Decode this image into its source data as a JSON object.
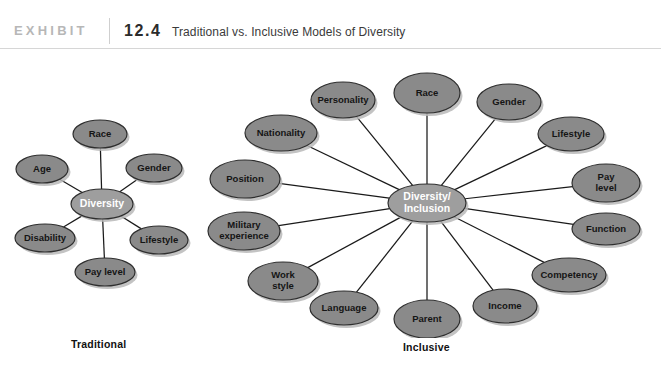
{
  "header": {
    "exhibit_word": "EXHIBIT",
    "exhibit_number": "12.4",
    "title": "Traditional vs. Inclusive Models of Diversity"
  },
  "captions": {
    "traditional": "Traditional",
    "inclusive": "Inclusive"
  },
  "source_credit": "",
  "colors": {
    "satellite_fill": "#8a8a8a",
    "center_fill": "#9e9e9e",
    "node_stroke": "#2e2e2e",
    "shadow": "#b9b9b9",
    "connector": "#1a1a1a",
    "satellite_text": "#151515",
    "center_text": "#ffffff",
    "rule": "#d6d6d6",
    "exhibit_word_color": "#b7b7b7"
  },
  "diagrams": [
    {
      "id": "traditional",
      "name": "traditional-diversity-model",
      "center": {
        "label": "Diversity",
        "lines": [
          "Diversity"
        ],
        "cx": 102,
        "cy": 154,
        "rx": 31,
        "ry": 15
      },
      "satellites": [
        {
          "label": "Race",
          "lines": [
            "Race"
          ],
          "cx": 100,
          "cy": 84,
          "rx": 27,
          "ry": 14
        },
        {
          "label": "Gender",
          "lines": [
            "Gender"
          ],
          "cx": 154,
          "cy": 118,
          "rx": 28,
          "ry": 14
        },
        {
          "label": "Lifestyle",
          "lines": [
            "Lifestyle"
          ],
          "cx": 159,
          "cy": 190,
          "rx": 29,
          "ry": 14
        },
        {
          "label": "Pay level",
          "lines": [
            "Pay level"
          ],
          "cx": 105,
          "cy": 222,
          "rx": 30,
          "ry": 14
        },
        {
          "label": "Disability",
          "lines": [
            "Disability"
          ],
          "cx": 45,
          "cy": 188,
          "rx": 30,
          "ry": 14
        },
        {
          "label": "Age",
          "lines": [
            "Age"
          ],
          "cx": 42,
          "cy": 119,
          "rx": 26,
          "ry": 14
        }
      ]
    },
    {
      "id": "inclusive",
      "name": "inclusive-diversity-model",
      "center": {
        "label": "Diversity/ Inclusion",
        "lines": [
          "Diversity/",
          "Inclusion"
        ],
        "cx": 427,
        "cy": 153,
        "rx": 39,
        "ry": 19
      },
      "satellites": [
        {
          "label": "Race",
          "lines": [
            "Race"
          ],
          "cx": 427,
          "cy": 43,
          "rx": 33,
          "ry": 20
        },
        {
          "label": "Gender",
          "lines": [
            "Gender"
          ],
          "cx": 509,
          "cy": 52,
          "rx": 32,
          "ry": 18
        },
        {
          "label": "Lifestyle",
          "lines": [
            "Lifestyle"
          ],
          "cx": 571,
          "cy": 84,
          "rx": 33,
          "ry": 17
        },
        {
          "label": "Pay level",
          "lines": [
            "Pay",
            "level"
          ],
          "cx": 606,
          "cy": 133,
          "rx": 34,
          "ry": 19
        },
        {
          "label": "Function",
          "lines": [
            "Function"
          ],
          "cx": 606,
          "cy": 179,
          "rx": 34,
          "ry": 16
        },
        {
          "label": "Competency",
          "lines": [
            "Competency"
          ],
          "cx": 569,
          "cy": 225,
          "rx": 37,
          "ry": 17
        },
        {
          "label": "Income",
          "lines": [
            "Income"
          ],
          "cx": 505,
          "cy": 256,
          "rx": 32,
          "ry": 17
        },
        {
          "label": "Parent",
          "lines": [
            "Parent"
          ],
          "cx": 427,
          "cy": 269,
          "rx": 33,
          "ry": 19
        },
        {
          "label": "Language",
          "lines": [
            "Language"
          ],
          "cx": 344,
          "cy": 258,
          "rx": 34,
          "ry": 17
        },
        {
          "label": "Work style",
          "lines": [
            "Work",
            "style"
          ],
          "cx": 283,
          "cy": 231,
          "rx": 35,
          "ry": 19
        },
        {
          "label": "Military experience",
          "lines": [
            "Military",
            "experience"
          ],
          "cx": 244,
          "cy": 181,
          "rx": 36,
          "ry": 19
        },
        {
          "label": "Position",
          "lines": [
            "Position"
          ],
          "cx": 245,
          "cy": 129,
          "rx": 35,
          "ry": 19
        },
        {
          "label": "Nationality",
          "lines": [
            "Nationality"
          ],
          "cx": 281,
          "cy": 83,
          "rx": 36,
          "ry": 18
        },
        {
          "label": "Personality",
          "lines": [
            "Personality"
          ],
          "cx": 343,
          "cy": 50,
          "rx": 32,
          "ry": 18
        }
      ]
    }
  ],
  "chart_data": {
    "type": "diagram",
    "title": "Traditional vs. Inclusive Models of Diversity",
    "panels": [
      {
        "name": "Traditional",
        "hub": "Diversity",
        "nodes": [
          "Race",
          "Gender",
          "Lifestyle",
          "Pay level",
          "Disability",
          "Age"
        ],
        "node_count": 6
      },
      {
        "name": "Inclusive",
        "hub": "Diversity/Inclusion",
        "nodes": [
          "Race",
          "Gender",
          "Lifestyle",
          "Pay level",
          "Function",
          "Competency",
          "Income",
          "Parent",
          "Language",
          "Work style",
          "Military experience",
          "Position",
          "Nationality",
          "Personality"
        ],
        "node_count": 14
      }
    ]
  }
}
